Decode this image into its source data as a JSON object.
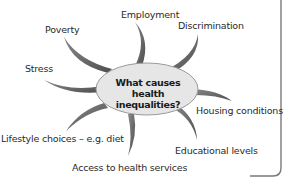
{
  "diagram": {
    "type": "spider-diagram",
    "center": {
      "line1": "What causes health",
      "line2": "inequalities?"
    },
    "branches": [
      {
        "label": "Employment"
      },
      {
        "label": "Discrimination"
      },
      {
        "label": "Poverty"
      },
      {
        "label": "Stress"
      },
      {
        "label": "Housing conditions"
      },
      {
        "label": "Lifestyle choices – e.g. diet"
      },
      {
        "label": "Educational levels"
      },
      {
        "label": "Access to health services"
      }
    ],
    "colors": {
      "spoke": "#5f5f5f",
      "ellipse_fill": "#e6e6e6",
      "ellipse_stroke": "#9a9a9a",
      "border": "#7a7a7a",
      "text": "#2a2a2a"
    }
  }
}
